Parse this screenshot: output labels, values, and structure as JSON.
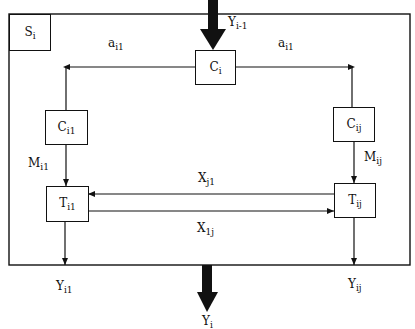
{
  "diagram": {
    "system_label": {
      "main": "S",
      "sub": "i"
    },
    "input": {
      "main": "Y",
      "sub": "i-1"
    },
    "output": {
      "main": "Y",
      "sub": "i"
    },
    "nodes": {
      "ci": {
        "main": "C",
        "sub": "i"
      },
      "ci1": {
        "main": "C",
        "sub": "i1"
      },
      "cij": {
        "main": "C",
        "sub": "ij"
      },
      "ti1": {
        "main": "T",
        "sub": "i1"
      },
      "tij": {
        "main": "T",
        "sub": "ij"
      }
    },
    "edges": {
      "a_left": {
        "main": "a",
        "sub": "i1"
      },
      "a_right": {
        "main": "a",
        "sub": "i1"
      },
      "m_left": {
        "main": "M",
        "sub": "i1"
      },
      "m_right": {
        "main": "M",
        "sub": "ij"
      },
      "x_top": {
        "main": "X",
        "sub": "j1"
      },
      "x_bottom": {
        "main": "X",
        "sub": "1j"
      },
      "y_left": {
        "main": "Y",
        "sub": "i1"
      },
      "y_right": {
        "main": "Y",
        "sub": "ij"
      }
    }
  }
}
